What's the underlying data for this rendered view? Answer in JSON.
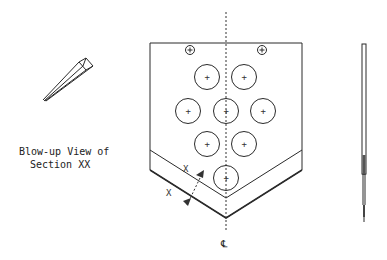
{
  "drawing": {
    "blowup_caption_line1": "Blow-up View of",
    "blowup_caption_line2": "Section XX",
    "centerline_symbol": "℄",
    "section_marker_1": "X",
    "section_marker_2": "X"
  },
  "plate": {
    "mounting_holes": 2,
    "large_holes": 8
  },
  "colors": {
    "line": "#2a2a2a",
    "background": "#ffffff"
  }
}
